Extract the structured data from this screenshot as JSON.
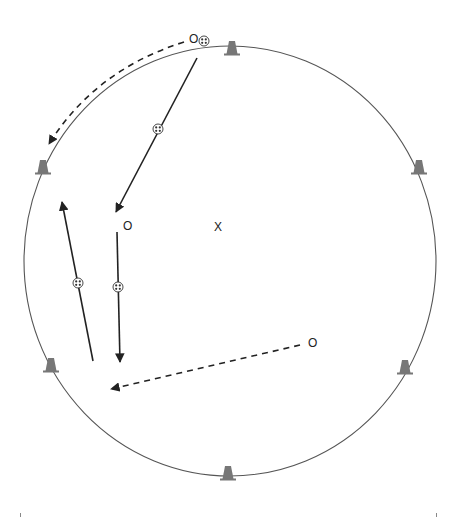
{
  "diagram": {
    "type": "soccer drill diagram",
    "colors": {
      "background": "#ffffff",
      "circle_stroke": "#555555",
      "arrow_stroke": "#222222",
      "cone_fill": "#777777",
      "text": "#222222"
    },
    "field": {
      "shape": "circle",
      "center": [
        230,
        261
      ],
      "radius_x": 206,
      "radius_y": 215
    },
    "center_marker": {
      "symbol": "X",
      "position": [
        218,
        227
      ]
    },
    "players": [
      {
        "id": "player-top",
        "symbol": "O",
        "position": [
          194,
          39
        ],
        "has_ball": true
      },
      {
        "id": "player-left-center",
        "symbol": "O",
        "position": [
          127,
          226
        ],
        "has_ball": false
      },
      {
        "id": "player-right",
        "symbol": "O",
        "position": [
          313,
          343
        ],
        "has_ball": false
      }
    ],
    "cones": [
      {
        "id": "cone-top",
        "position": [
          232,
          51
        ]
      },
      {
        "id": "cone-upper-left",
        "position": [
          43,
          170
        ]
      },
      {
        "id": "cone-upper-right",
        "position": [
          419,
          170
        ]
      },
      {
        "id": "cone-lower-left",
        "position": [
          51,
          368
        ]
      },
      {
        "id": "cone-lower-right",
        "position": [
          405,
          370
        ]
      },
      {
        "id": "cone-bottom",
        "position": [
          228,
          476
        ]
      }
    ],
    "arrows": [
      {
        "id": "run-top-player-dashed",
        "style": "dashed",
        "from": [
          184,
          41
        ],
        "to": [
          49,
          144
        ],
        "curved": true,
        "control": [
          100,
          65
        ],
        "meaning": "player run"
      },
      {
        "id": "pass-top-to-center",
        "style": "solid",
        "from": [
          197,
          58
        ],
        "to": [
          116,
          212
        ],
        "meaning": "dribble/pass with ball"
      },
      {
        "id": "dribble-center-down",
        "style": "solid",
        "from": [
          117,
          232
        ],
        "to": [
          120,
          362
        ],
        "meaning": "dribble with ball"
      },
      {
        "id": "dribble-left-up",
        "style": "solid",
        "from": [
          93,
          361
        ],
        "to": [
          62,
          202
        ],
        "meaning": "dribble with ball"
      },
      {
        "id": "run-right-dashed",
        "style": "dashed",
        "from": [
          300,
          345
        ],
        "to": [
          111,
          389
        ],
        "curved": false,
        "meaning": "player run"
      }
    ],
    "balls": [
      {
        "id": "ball-top-player",
        "position": [
          204,
          41
        ]
      },
      {
        "id": "ball-on-diagonal",
        "position": [
          158,
          129
        ]
      },
      {
        "id": "ball-center-line",
        "position": [
          118,
          287
        ]
      },
      {
        "id": "ball-left-line",
        "position": [
          78,
          283
        ]
      }
    ]
  }
}
